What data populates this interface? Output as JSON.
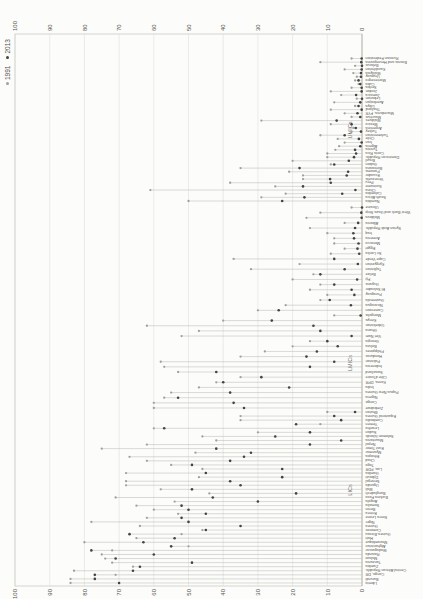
{
  "legend": {
    "items": [
      {
        "label": "1991",
        "color": "#a0a09c"
      },
      {
        "label": "2013",
        "color": "#454442"
      }
    ]
  },
  "chart_data": {
    "type": "dumbbell",
    "orientation": "landscape chart rotated 90deg counter-clockwise",
    "value_axis": {
      "min": 0,
      "max": 100,
      "ticks": [
        0,
        10,
        20,
        30,
        40,
        50,
        60,
        70,
        80,
        90,
        100
      ],
      "tick_sides": "both"
    },
    "grid": true,
    "marker_1991_color": "#a0a09c",
    "marker_2013_color": "#454442",
    "range_line_color": "#bcbcb8",
    "groups": [
      {
        "label": "UMICs",
        "countries": [
          {
            "name": "Russian Federation",
            "v1991": 3,
            "v2013": 0.1
          },
          {
            "name": "Bosnia and Herzegovina",
            "v1991": 12,
            "v2013": 0.2
          },
          {
            "name": "Belarus",
            "v1991": 2,
            "v2013": 0
          },
          {
            "name": "Kazakhstan",
            "v1991": 5,
            "v2013": 0.1
          },
          {
            "name": "Malaysia",
            "v1991": 2.5,
            "v2013": 0.3
          },
          {
            "name": "Uruguay",
            "v1991": 1.5,
            "v2013": 0.3
          },
          {
            "name": "Montenegro",
            "v1991": 2,
            "v2013": 1
          },
          {
            "name": "Cuba",
            "v1991": 1,
            "v2013": 0.5
          },
          {
            "name": "Serbia",
            "v1991": 3,
            "v2013": 0.1
          },
          {
            "name": "Jordan",
            "v1991": 9,
            "v2013": 0.1
          },
          {
            "name": "Jamaica",
            "v1991": 6,
            "v2013": 1.7
          },
          {
            "name": "Lebanon",
            "v1991": 1.5,
            "v2013": 0
          },
          {
            "name": "Azerbaijan",
            "v1991": 8,
            "v2013": 0.5
          },
          {
            "name": "Libya",
            "v1991": 2,
            "v2013": 1
          },
          {
            "name": "Thailand",
            "v1991": 9,
            "v2013": 0.1
          },
          {
            "name": "Macedonia, FYR",
            "v1991": 5,
            "v2013": 1.3
          },
          {
            "name": "Mauritius",
            "v1991": 3,
            "v2013": 0.5
          },
          {
            "name": "Maldives",
            "v1991": 29,
            "v2013": 7.3
          },
          {
            "name": "Mexico",
            "v1991": 9,
            "v2013": 3
          },
          {
            "name": "Argentina",
            "v1991": 2.5,
            "v2013": 1.8
          },
          {
            "name": "Turkey",
            "v1991": 3,
            "v2013": 0.3
          },
          {
            "name": "Turkmenistan",
            "v1991": 12,
            "v2013": 5
          },
          {
            "name": "Chile",
            "v1991": 7,
            "v2013": 0.9
          },
          {
            "name": "Iran",
            "v1991": 5,
            "v2013": 0.1
          },
          {
            "name": "Algeria",
            "v1991": 6.6,
            "v2013": 0.5
          },
          {
            "name": "Tunisia",
            "v1991": 7.7,
            "v2013": 2
          },
          {
            "name": "Costa Rica",
            "v1991": 10,
            "v2013": 1.7
          },
          {
            "name": "Dominican Republic",
            "v1991": 10,
            "v2013": 2.3
          },
          {
            "name": "Brazil",
            "v1991": 20,
            "v2013": 3.8
          },
          {
            "name": "Gabon",
            "v1991": 9,
            "v2013": 8
          },
          {
            "name": "Botswana",
            "v1991": 35,
            "v2013": 18
          },
          {
            "name": "Panama",
            "v1991": 21,
            "v2013": 4
          },
          {
            "name": "Ecuador",
            "v1991": 17,
            "v2013": 4.4
          },
          {
            "name": "Venezuela",
            "v1991": 17,
            "v2013": 9.2
          },
          {
            "name": "Peru",
            "v1991": 38,
            "v2013": 9
          },
          {
            "name": "Suriname",
            "v1991": 25,
            "v2013": 17
          },
          {
            "name": "China",
            "v1991": 61,
            "v2013": 1.9
          },
          {
            "name": "Colombia",
            "v1991": 22,
            "v2013": 5.7
          },
          {
            "name": "South Africa",
            "v1991": 29,
            "v2013": 16.6
          },
          {
            "name": "Namibia",
            "v1991": 50,
            "v2013": 23
          }
        ]
      },
      {
        "label": "LMICs",
        "countries": [
          {
            "name": "Ukraine",
            "v1991": 3,
            "v2013": 0
          },
          {
            "name": "West Bank and Gaza Strip",
            "v1991": 12,
            "v2013": 0.2
          },
          {
            "name": "Moldova",
            "v1991": 16,
            "v2013": 0.1
          },
          {
            "name": "Albania",
            "v1991": 5,
            "v2013": 1.1
          },
          {
            "name": "Syrian Arab Republic",
            "v1991": 15,
            "v2013": 2
          },
          {
            "name": "Iraq",
            "v1991": 10,
            "v2013": 2.5
          },
          {
            "name": "Armenia",
            "v1991": 8,
            "v2013": 2.3
          },
          {
            "name": "Morocco",
            "v1991": 8,
            "v2013": 1
          },
          {
            "name": "Egypt",
            "v1991": 5,
            "v2013": 1.3
          },
          {
            "name": "Sri Lanka",
            "v1991": 9,
            "v2013": 0.8
          },
          {
            "name": "Cape Verde",
            "v1991": 37,
            "v2013": 8
          },
          {
            "name": "Kyrgyzstan",
            "v1991": 18,
            "v2013": 1.2
          },
          {
            "name": "Tajikistan",
            "v1991": 32,
            "v2013": 5
          },
          {
            "name": "Belize",
            "v1991": 14,
            "v2013": 12
          },
          {
            "name": "Fiji",
            "v1991": 20,
            "v2013": 1.4
          },
          {
            "name": "Guyana",
            "v1991": 12,
            "v2013": 8
          },
          {
            "name": "El Salvador",
            "v1991": 15,
            "v2013": 3
          },
          {
            "name": "Paraguay",
            "v1991": 10,
            "v2013": 2.2
          },
          {
            "name": "Guatemala",
            "v1991": 12,
            "v2013": 9.3
          },
          {
            "name": "Nicaragua",
            "v1991": 22,
            "v2013": 3.2
          },
          {
            "name": "Cameroon",
            "v1991": 30,
            "v2013": 24
          },
          {
            "name": "Mongolia",
            "v1991": 8,
            "v2013": 0.4
          },
          {
            "name": "Kenya",
            "v1991": 40,
            "v2013": 26
          },
          {
            "name": "Uzbekistan",
            "v1991": 62,
            "v2013": 14
          },
          {
            "name": "Ghana",
            "v1991": 47,
            "v2013": 12
          },
          {
            "name": "Viet Nam",
            "v1991": 52,
            "v2013": 3
          },
          {
            "name": "Georgia",
            "v1991": 15,
            "v2013": 10
          },
          {
            "name": "Bolivia",
            "v1991": 20,
            "v2013": 7
          },
          {
            "name": "Philippines",
            "v1991": 28,
            "v2013": 13
          },
          {
            "name": "Honduras",
            "v1991": 35,
            "v2013": 16
          },
          {
            "name": "Pakistan",
            "v1991": 58,
            "v2013": 8
          },
          {
            "name": "Indonesia",
            "v1991": 57,
            "v2013": 15
          },
          {
            "name": "Swaziland",
            "v1991": 53,
            "v2013": 42
          },
          {
            "name": "Côte d'Ivoire",
            "v1991": 35,
            "v2013": 29
          },
          {
            "name": "Korea, DPR",
            "v1991": 42,
            "v2013": 40
          },
          {
            "name": "India",
            "v1991": 47,
            "v2013": 21
          },
          {
            "name": "Papua New Guinea",
            "v1991": 55,
            "v2013": 38
          },
          {
            "name": "Nigeria",
            "v1991": 57,
            "v2013": 53
          },
          {
            "name": "Congo",
            "v1991": 60,
            "v2013": 37
          },
          {
            "name": "Zimbabwe",
            "v1991": 60,
            "v2013": 34
          }
        ]
      },
      {
        "label": "LICs",
        "countries": [
          {
            "name": "Bhutan",
            "v1991": 10,
            "v2013": 2
          },
          {
            "name": "Equatorial Guinea",
            "v1991": 35,
            "v2013": 8
          },
          {
            "name": "Cambodia",
            "v1991": 35,
            "v2013": 6
          },
          {
            "name": "Yemen",
            "v1991": 12,
            "v2013": 19
          },
          {
            "name": "Lesotho",
            "v1991": 60,
            "v2013": 57
          },
          {
            "name": "Sudan",
            "v1991": 30,
            "v2013": 15
          },
          {
            "name": "Solomon Islands",
            "v1991": 46,
            "v2013": 25
          },
          {
            "name": "Mauritania",
            "v1991": 42,
            "v2013": 6
          },
          {
            "name": "Nepal",
            "v1991": 62,
            "v2013": 15
          },
          {
            "name": "East Timor",
            "v1991": 75,
            "v2013": 42
          },
          {
            "name": "Myanmar",
            "v1991": 48,
            "v2013": 32
          },
          {
            "name": "Ethiopia",
            "v1991": 67,
            "v2013": 34
          },
          {
            "name": "Chad",
            "v1991": 62,
            "v2013": 38
          },
          {
            "name": "Togo",
            "v1991": 55,
            "v2013": 49
          },
          {
            "name": "Lao, PDR",
            "v1991": 46,
            "v2013": 23
          },
          {
            "name": "Gambia",
            "v1991": 68,
            "v2013": 45
          },
          {
            "name": "Djibouti",
            "v1991": 47,
            "v2013": 23
          },
          {
            "name": "Senegal",
            "v1991": 68,
            "v2013": 38
          },
          {
            "name": "Uganda",
            "v1991": 68,
            "v2013": 35
          },
          {
            "name": "Mali",
            "v1991": 58,
            "v2013": 49
          },
          {
            "name": "Bangladesh",
            "v1991": 44,
            "v2013": 19
          },
          {
            "name": "Burkina Faso",
            "v1991": 71,
            "v2013": 43
          },
          {
            "name": "Angola",
            "v1991": 54,
            "v2013": 30
          },
          {
            "name": "Somalia",
            "v1991": 65,
            "v2013": 52
          },
          {
            "name": "Benin",
            "v1991": 60,
            "v2013": 50
          },
          {
            "name": "Eritrea",
            "v1991": 53,
            "v2013": 45
          },
          {
            "name": "Sierra Leone",
            "v1991": 62,
            "v2013": 52
          },
          {
            "name": "Niger",
            "v1991": 78,
            "v2013": 50
          },
          {
            "name": "Guinea",
            "v1991": 64,
            "v2013": 35
          },
          {
            "name": "Comoros",
            "v1991": 46,
            "v2013": 45
          },
          {
            "name": "Guinea-Bissau",
            "v1991": 52,
            "v2013": 67
          },
          {
            "name": "Haiti",
            "v1991": 65,
            "v2013": 54
          },
          {
            "name": "Mozambique",
            "v1991": 80,
            "v2013": 63
          },
          {
            "name": "Afghanistan",
            "v1991": 50,
            "v2013": 55
          },
          {
            "name": "Madagascar",
            "v1991": 72,
            "v2013": 78
          },
          {
            "name": "Rwanda",
            "v1991": 75,
            "v2013": 60
          },
          {
            "name": "Malawi",
            "v1991": 74,
            "v2013": 71
          },
          {
            "name": "Tanzania",
            "v1991": 72,
            "v2013": 49
          },
          {
            "name": "Zambia",
            "v1991": 66,
            "v2013": 64
          },
          {
            "name": "Central African Republic",
            "v1991": 83,
            "v2013": 66
          },
          {
            "name": "Congo, DR",
            "v1991": 71,
            "v2013": 77
          },
          {
            "name": "Burundi",
            "v1991": 84,
            "v2013": 77
          },
          {
            "name": "Liberia",
            "v1991": 84,
            "v2013": 70
          }
        ]
      }
    ]
  }
}
